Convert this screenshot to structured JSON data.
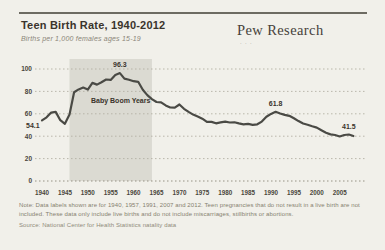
{
  "header": {
    "title": "Teen Birth Rate, 1940-2012",
    "subtitle": "Births per 1,000 females ages 15-19",
    "logo_text": "Pew Research",
    "logo_subtext": "· · ·"
  },
  "footnotes": {
    "note": "Note: Data labels shown are for 1940, 1957, 1991, 2007 and 2012. Teen pregnancies that do not result in a live birth are not included. These data only include live births and do not include miscarriages, stillbirths or abortions.",
    "source": "Source: National Center for Health Statistics natality data"
  },
  "chart_data": {
    "type": "line",
    "title": "Teen Birth Rate, 1940-2012",
    "xlabel": "",
    "ylabel": "Births per 1,000 females ages 15-19",
    "ylim": [
      0,
      100
    ],
    "yticks": [
      0,
      20,
      40,
      60,
      80,
      100
    ],
    "xticks": [
      1940,
      1945,
      1950,
      1955,
      1960,
      1965,
      1970,
      1975,
      1980,
      1985,
      1990,
      1995,
      2000,
      2005
    ],
    "grid": "dotted-horizontal",
    "legend": "none",
    "line_color": "#4a4a45",
    "grid_color": "#b3b0a4",
    "text_color": "#3a342c",
    "tick_color": "#4a463c",
    "shaded_region": {
      "label": "Baby Boom Years",
      "from_year": 1946,
      "to_year": 1964,
      "color": "#dbdad2"
    },
    "point_labels": [
      {
        "year": 1940,
        "value": 54.1,
        "text": "54.1"
      },
      {
        "year": 1957,
        "value": 96.3,
        "text": "96.3"
      },
      {
        "year": 1991,
        "value": 61.8,
        "text": "61.8"
      },
      {
        "year": 2007,
        "value": 41.5,
        "text": "41.5"
      }
    ],
    "series": [
      {
        "name": "Teen birth rate",
        "points": [
          [
            1940,
            54.1
          ],
          [
            1941,
            56.9
          ],
          [
            1942,
            61.1
          ],
          [
            1943,
            61.7
          ],
          [
            1944,
            54.3
          ],
          [
            1945,
            51.1
          ],
          [
            1946,
            59.3
          ],
          [
            1947,
            79.3
          ],
          [
            1948,
            81.8
          ],
          [
            1949,
            83.4
          ],
          [
            1950,
            81.6
          ],
          [
            1951,
            87.6
          ],
          [
            1952,
            86.1
          ],
          [
            1953,
            88.2
          ],
          [
            1954,
            90.6
          ],
          [
            1955,
            90.3
          ],
          [
            1956,
            94.6
          ],
          [
            1957,
            96.3
          ],
          [
            1958,
            91.4
          ],
          [
            1959,
            90.4
          ],
          [
            1960,
            89.1
          ],
          [
            1961,
            88.6
          ],
          [
            1962,
            81.4
          ],
          [
            1963,
            76.7
          ],
          [
            1964,
            73.1
          ],
          [
            1965,
            70.5
          ],
          [
            1966,
            70.3
          ],
          [
            1967,
            67.5
          ],
          [
            1968,
            65.6
          ],
          [
            1969,
            65.5
          ],
          [
            1970,
            68.3
          ],
          [
            1971,
            64.5
          ],
          [
            1972,
            61.7
          ],
          [
            1973,
            59.3
          ],
          [
            1974,
            57.5
          ],
          [
            1975,
            55.6
          ],
          [
            1976,
            52.8
          ],
          [
            1977,
            52.8
          ],
          [
            1978,
            51.5
          ],
          [
            1979,
            52.3
          ],
          [
            1980,
            53.0
          ],
          [
            1981,
            52.2
          ],
          [
            1982,
            52.4
          ],
          [
            1983,
            51.4
          ],
          [
            1984,
            50.6
          ],
          [
            1985,
            51.0
          ],
          [
            1986,
            50.2
          ],
          [
            1987,
            50.6
          ],
          [
            1988,
            53.0
          ],
          [
            1989,
            57.3
          ],
          [
            1990,
            59.9
          ],
          [
            1991,
            61.8
          ],
          [
            1992,
            60.3
          ],
          [
            1993,
            59.0
          ],
          [
            1994,
            58.2
          ],
          [
            1995,
            56.0
          ],
          [
            1996,
            53.5
          ],
          [
            1997,
            51.3
          ],
          [
            1998,
            50.3
          ],
          [
            1999,
            48.8
          ],
          [
            2000,
            47.7
          ],
          [
            2001,
            45.3
          ],
          [
            2002,
            43.0
          ],
          [
            2003,
            41.6
          ],
          [
            2004,
            41.1
          ],
          [
            2005,
            39.7
          ],
          [
            2006,
            41.1
          ],
          [
            2007,
            41.5
          ],
          [
            2008,
            40.2
          ]
        ]
      }
    ]
  }
}
